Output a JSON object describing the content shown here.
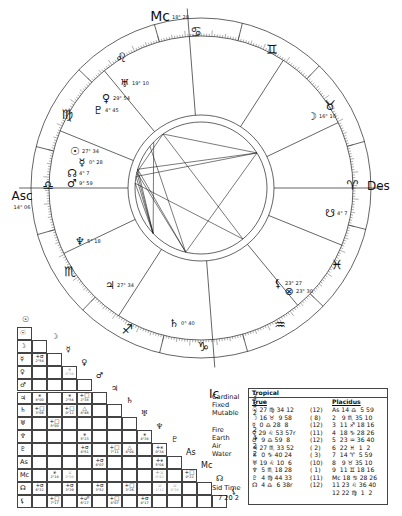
{
  "wheel": {
    "angles": {
      "Mc": "Mc",
      "Ic": "Ic",
      "Asc": "Asc",
      "Des": "Des"
    },
    "mc_degree": "18° 28",
    "asc_degree": "14° 06",
    "signs": [
      {
        "name": "cancer",
        "glyph": "♋",
        "x": 196,
        "y": 32
      },
      {
        "name": "gemini",
        "glyph": "♊",
        "x": 272,
        "y": 50
      },
      {
        "name": "taurus",
        "glyph": "♉",
        "x": 330,
        "y": 106
      },
      {
        "name": "aries",
        "glyph": "♈",
        "x": 352,
        "y": 186
      },
      {
        "name": "pisces",
        "glyph": "♓",
        "x": 337,
        "y": 265
      },
      {
        "name": "aquarius",
        "glyph": "♒",
        "x": 280,
        "y": 325
      },
      {
        "name": "capricorn",
        "glyph": "♑",
        "x": 203,
        "y": 347
      },
      {
        "name": "sagittarius",
        "glyph": "♐",
        "x": 127,
        "y": 330
      },
      {
        "name": "scorpio",
        "glyph": "♏",
        "x": 70,
        "y": 272
      },
      {
        "name": "libra",
        "glyph": "♎",
        "x": 48,
        "y": 186
      },
      {
        "name": "virgo",
        "glyph": "♍",
        "x": 67,
        "y": 115
      },
      {
        "name": "leo",
        "glyph": "♌",
        "x": 121,
        "y": 58
      }
    ],
    "planets": [
      {
        "name": "uranus",
        "glyph": "♅",
        "label": "19° 10",
        "x": 125,
        "y": 83
      },
      {
        "name": "venus",
        "glyph": "♀",
        "label": "29° 54",
        "x": 106,
        "y": 98
      },
      {
        "name": "pluto",
        "glyph": "♇",
        "label": "4° 45",
        "x": 98,
        "y": 110
      },
      {
        "name": "sun",
        "glyph": "☉",
        "label": "27° 34",
        "x": 75,
        "y": 151
      },
      {
        "name": "mercury",
        "glyph": "☿",
        "label": "0° 28",
        "x": 82,
        "y": 162
      },
      {
        "name": "north-node",
        "glyph": "☊",
        "label": "4° 7",
        "x": 72,
        "y": 173
      },
      {
        "name": "mars",
        "glyph": "♂",
        "label": "9° 59",
        "x": 72,
        "y": 183
      },
      {
        "name": "moon",
        "glyph": "☽",
        "label": "16° 10",
        "x": 312,
        "y": 116
      },
      {
        "name": "south-node",
        "glyph": "☋",
        "label": "4° 7",
        "x": 330,
        "y": 213
      },
      {
        "name": "neptune",
        "glyph": "♆",
        "label": "5° 18",
        "x": 80,
        "y": 241
      },
      {
        "name": "jupiter",
        "glyph": "♃",
        "label": "27° 34",
        "x": 110,
        "y": 285
      },
      {
        "name": "saturn",
        "glyph": "♄",
        "label": "0° 40",
        "x": 174,
        "y": 323
      },
      {
        "name": "lilith",
        "glyph": "⚸",
        "label": "23° 27",
        "x": 278,
        "y": 283
      },
      {
        "name": "fortune",
        "glyph": "⊗",
        "label": "23° 30",
        "x": 289,
        "y": 291
      }
    ]
  },
  "aspect_grid": {
    "rows": [
      "☉",
      "☽",
      "☿",
      "♀",
      "♂",
      "♃",
      "♄",
      "♅",
      "♆",
      "♇",
      "As",
      "Mc",
      "☊",
      "⚸"
    ],
    "cells": [
      {
        "r": 2,
        "c": 0,
        "asp": "+σ",
        "orb": "2°54"
      },
      {
        "r": 3,
        "c": 2,
        "asp": "⚹",
        "orb": "0°34",
        "faint": true
      },
      {
        "r": 5,
        "c": 0,
        "asp": "⚹",
        "orb": "8°00"
      },
      {
        "r": 5,
        "c": 2,
        "asp": "⚹",
        "orb": "2°54"
      },
      {
        "r": 5,
        "c": 3,
        "asp": "+□",
        "orb": "2°38"
      },
      {
        "r": 6,
        "c": 0,
        "asp": "+□",
        "orb": "3°06"
      },
      {
        "r": 6,
        "c": 2,
        "asp": "+□",
        "orb": "0°12"
      },
      {
        "r": 6,
        "c": 3,
        "asp": "△",
        "orb": "8°46"
      },
      {
        "r": 7,
        "c": 1,
        "asp": "+□",
        "orb": "5°00"
      },
      {
        "r": 8,
        "c": 3,
        "asp": "⚹",
        "orb": "5°23"
      },
      {
        "r": 8,
        "c": 7,
        "asp": "⚹",
        "orb": "4°38"
      },
      {
        "r": 9,
        "c": 3,
        "asp": "+σ",
        "orb": "4°51"
      },
      {
        "r": 9,
        "c": 5,
        "asp": "+□",
        "orb": "7°11"
      },
      {
        "r": 9,
        "c": 6,
        "asp": "△",
        "orb": "4°04"
      },
      {
        "r": 9,
        "c": 8,
        "asp": "+⚹",
        "orb": "0°34"
      },
      {
        "r": 10,
        "c": 4,
        "asp": "+σ",
        "orb": "4°07"
      },
      {
        "r": 10,
        "c": 8,
        "asp": "+⚹",
        "orb": "5°04"
      },
      {
        "r": 11,
        "c": 1,
        "asp": "⚹",
        "orb": "2°18"
      },
      {
        "r": 11,
        "c": 2,
        "asp": "⚺",
        "orb": "0°08",
        "faint": true
      },
      {
        "r": 11,
        "c": 8,
        "asp": "+⚺",
        "orb": "0°42",
        "faint": true
      },
      {
        "r": 11,
        "c": 10,
        "asp": "+□",
        "orb": "0°22"
      },
      {
        "r": 12,
        "c": 0,
        "asp": "+σ",
        "orb": "6°32"
      },
      {
        "r": 12,
        "c": 2,
        "asp": "+σ",
        "orb": "3°39"
      },
      {
        "r": 12,
        "c": 4,
        "asp": "+σ",
        "orb": "3°52"
      },
      {
        "r": 12,
        "c": 6,
        "asp": "+□",
        "orb": "3°26"
      },
      {
        "r": 12,
        "c": 8,
        "asp": "⚺",
        "orb": "1°12",
        "faint": true
      },
      {
        "r": 12,
        "c": 9,
        "asp": "⚺",
        "orb": "0°38",
        "faint": true
      },
      {
        "r": 13,
        "c": 1,
        "asp": "+□",
        "orb": "7°17"
      },
      {
        "r": 13,
        "c": 3,
        "asp": "+☍",
        "orb": "6°27"
      },
      {
        "r": 13,
        "c": 5,
        "asp": "+□",
        "orb": "4°07"
      },
      {
        "r": 13,
        "c": 7,
        "asp": "+σ",
        "orb": "4°17"
      }
    ]
  },
  "elements": {
    "modes": [
      {
        "label": "Cardinal",
        "count": "3"
      },
      {
        "label": "Fixed",
        "count": "5"
      },
      {
        "label": "Mutable",
        "count": "2"
      }
    ],
    "elements": [
      {
        "label": "Fire",
        "count": "2"
      },
      {
        "label": "Earth",
        "count": "4"
      },
      {
        "label": "Air",
        "count": "2"
      },
      {
        "label": "Water",
        "count": "2"
      }
    ],
    "sid_time_label": "Sid Time",
    "sid_time_value": "7 20 2"
  },
  "positions_table": {
    "title": "Tropical",
    "col_true": "True",
    "col_placidus": "Placidus",
    "rows": [
      {
        "planet": "☉ 27 ♍ 34 12",
        "house": "(12)",
        "cusp": "As 14 ♎  5 59"
      },
      {
        "planet": "☽ 16 ♉  9 58",
        "house": "( 8)",
        "cusp": "2   9 ♏ 35 10"
      },
      {
        "planet": "☿  0 ♎ 28  8",
        "house": "(12)",
        "cusp": "3  11 ♐ 18 16"
      },
      {
        "planet": "♀ 29 ♌ 53 57r",
        "house": "(11)",
        "cusp": "4  18 ♑ 28 26"
      },
      {
        "planet": "♂  9 ♎ 59  8",
        "house": "(12)",
        "cusp": "5  23 ♒ 36 40"
      },
      {
        "planet": "♃ 27 ♏ 33 52",
        "house": "( 2)",
        "cusp": "6  22 ♓  1  2"
      },
      {
        "planet": "♄  0 ♑ 40 24",
        "house": "( 3)",
        "cusp": "7  14 ♈  5 59"
      },
      {
        "planet": "♅ 19 ♌ 10  6",
        "house": "(10)",
        "cusp": "8   9 ♉ 35 10"
      },
      {
        "planet": "♆  5 ♏ 18 28",
        "house": "( 1)",
        "cusp": "9  11 ♊ 18 16"
      },
      {
        "planet": "♇  4 ♍ 44 33",
        "house": "(11)",
        "cusp": "Mc 18 ♋ 28 26"
      },
      {
        "planet": "☊  4 ♎  6 38r",
        "house": "(12)",
        "cusp": "11 23 ♌ 36 40"
      },
      {
        "planet": "",
        "house": "",
        "cusp": "12 22 ♍  1  2"
      }
    ]
  }
}
